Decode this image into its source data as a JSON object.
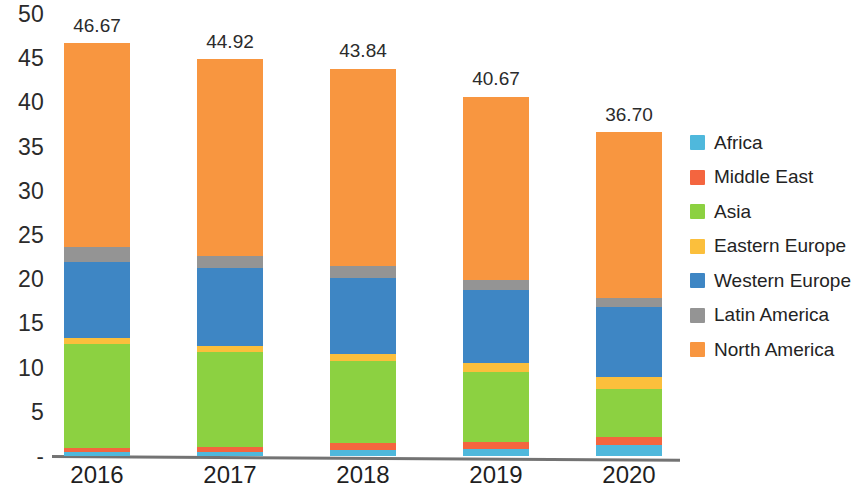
{
  "chart_data": {
    "type": "bar",
    "subtype": "stacked-bar",
    "title": "",
    "subtitle": "",
    "xlabel": "",
    "ylabel": "",
    "categories": [
      "2016",
      "2017",
      "2018",
      "2019",
      "2020"
    ],
    "ylim": [
      0,
      50
    ],
    "yticks": [
      "-",
      "5",
      "10",
      "15",
      "20",
      "25",
      "30",
      "35",
      "40",
      "45",
      "50"
    ],
    "ytick_values": [
      0,
      5,
      10,
      15,
      20,
      25,
      30,
      35,
      40,
      45,
      50
    ],
    "grid": false,
    "legend_position": "right",
    "stack_order_bottom_to_top": [
      "Africa",
      "Middle East",
      "Asia",
      "Eastern Europe",
      "Western Europe",
      "Latin America",
      "North America"
    ],
    "series": [
      {
        "name": "Africa",
        "color": "#4FB8DC",
        "values": [
          0.4,
          0.45,
          0.7,
          0.8,
          1.2
        ]
      },
      {
        "name": "Middle East",
        "color": "#F4653F",
        "values": [
          0.5,
          0.55,
          0.75,
          0.75,
          0.9
        ]
      },
      {
        "name": "Asia",
        "color": "#8CD141",
        "values": [
          11.8,
          10.8,
          9.3,
          8.0,
          5.5
        ]
      },
      {
        "name": "Eastern Europe",
        "color": "#FBBF3C",
        "values": [
          0.6,
          0.65,
          0.8,
          0.95,
          1.3
        ]
      },
      {
        "name": "Western Europe",
        "color": "#3E86C4",
        "values": [
          8.7,
          8.8,
          8.6,
          8.3,
          8.0
        ]
      },
      {
        "name": "Latin America",
        "color": "#949494",
        "values": [
          1.6,
          1.4,
          1.3,
          1.1,
          1.0
        ]
      },
      {
        "name": "North America",
        "color": "#F89640",
        "values": [
          23.07,
          22.27,
          22.39,
          20.77,
          18.8
        ]
      }
    ],
    "totals": [
      46.67,
      44.92,
      43.84,
      40.67,
      36.7
    ],
    "total_labels": [
      "46.67",
      "44.92",
      "43.84",
      "40.67",
      "36.70"
    ]
  },
  "legend": {
    "items": [
      {
        "label": "Africa",
        "color": "#4FB8DC"
      },
      {
        "label": "Middle East",
        "color": "#F4653F"
      },
      {
        "label": "Asia",
        "color": "#8CD141"
      },
      {
        "label": "Eastern Europe",
        "color": "#FBBF3C"
      },
      {
        "label": "Western Europe",
        "color": "#3E86C4"
      },
      {
        "label": "Latin America",
        "color": "#949494"
      },
      {
        "label": "North America",
        "color": "#F89640"
      }
    ]
  }
}
